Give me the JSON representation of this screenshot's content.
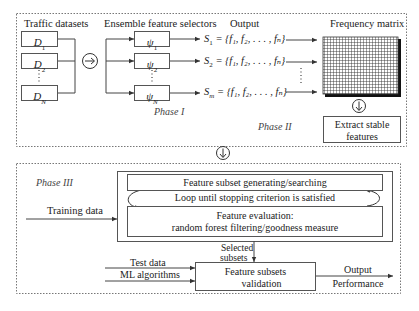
{
  "diagram": {
    "panel_top": {
      "traffic_datasets": {
        "label": "Traffic datasets",
        "items": [
          {
            "base": "D",
            "sub": "1"
          },
          {
            "base": "D",
            "sub": "2"
          },
          {
            "base": "D",
            "sub": "N"
          }
        ]
      },
      "ensemble": {
        "label": "Ensemble feature selectors",
        "items": [
          {
            "base": "ψ",
            "sub": "1"
          },
          {
            "base": "ψ",
            "sub": "2"
          },
          {
            "base": "ψ",
            "sub": "N"
          }
        ]
      },
      "output": {
        "label": "Output",
        "items": [
          {
            "s": "S",
            "sub": "1",
            "rest": " = {f₁, f₂, . . . , fₙ}"
          },
          {
            "s": "S",
            "sub": "2",
            "rest": " = {f₁, f₂, . . . , fₙ}"
          },
          {
            "s": "S",
            "sub": "m",
            "rest": " = {f₁, f₂, . . . , fₙ}"
          }
        ]
      },
      "frequency_matrix": {
        "label": "Frequency matrix"
      },
      "extract": {
        "line1": "Extract stable",
        "line2": "features"
      },
      "phase1": "Phase I",
      "phase2": "Phase II"
    },
    "panel_bottom": {
      "phase3": "Phase III",
      "training_data": "Training data",
      "generating": "Feature subset generating/searching",
      "loop": "Loop until stopping criterion is satisfied",
      "evaluation_line1": "Feature evaluation:",
      "evaluation_line2": "random forest filtering/goodness measure",
      "selected_line1": "Selected",
      "selected_line2": "subsets",
      "test_data": "Test data",
      "ml_algorithms": "ML algorithms",
      "validation_line1": "Feature subsets",
      "validation_line2": "validation",
      "output": "Output",
      "performance": "Performance"
    }
  }
}
